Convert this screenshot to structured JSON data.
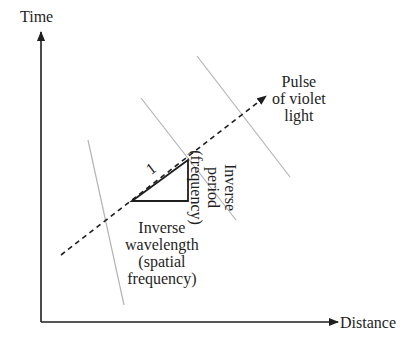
{
  "diagram": {
    "axes": {
      "y_label": "Time",
      "x_label": "Distance",
      "origin": [
        41,
        322
      ],
      "y_top": 30,
      "x_right": 340
    },
    "pulse": {
      "label_lines": [
        "Pulse",
        "of violet",
        "light"
      ],
      "start": [
        61,
        255
      ],
      "end": [
        266,
        96
      ],
      "style": "dashed"
    },
    "wavefronts": [
      {
        "from": [
          88,
          140
        ],
        "to": [
          124,
          305
        ]
      },
      {
        "from": [
          141,
          98
        ],
        "to": [
          236,
          220
        ]
      },
      {
        "from": [
          197,
          56
        ],
        "to": [
          290,
          177
        ]
      }
    ],
    "triangle": {
      "points": [
        [
          132,
          201
        ],
        [
          188,
          160
        ],
        [
          188,
          201
        ]
      ],
      "hypotenuse_label": "1"
    },
    "labels": {
      "inverse_wavelength": [
        "Inverse",
        "wavelength",
        "(spatial",
        "frequency)"
      ],
      "inverse_period": [
        "Inverse",
        "period",
        "(frequency)"
      ]
    },
    "colors": {
      "ink": "#1e1e1e",
      "wavefront": "#b4b4b4",
      "background": "#ffffff"
    }
  }
}
